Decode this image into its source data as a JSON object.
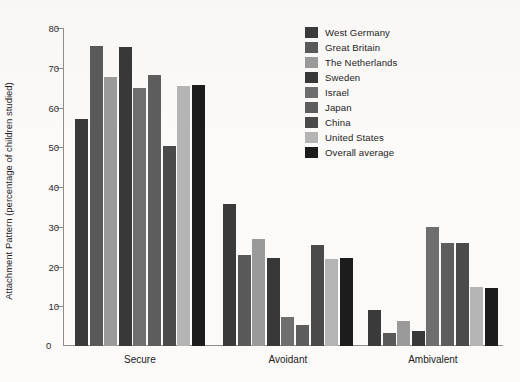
{
  "chart_data": {
    "type": "bar",
    "title": "",
    "subtitle": "",
    "xlabel": "",
    "ylabel": "Attachment Pattern (percentage of children studied)",
    "categories": [
      "Secure",
      "Avoidant",
      "Ambivalent"
    ],
    "ylim": [
      0,
      80
    ],
    "yticks": [
      0,
      10,
      20,
      30,
      40,
      50,
      60,
      70,
      80
    ],
    "ytick_labels": [
      "0",
      "10",
      "20",
      "30",
      "40",
      "50",
      "60",
      "70",
      "80"
    ],
    "grid": false,
    "legend_position": "upper right",
    "series": [
      {
        "name": "West Germany",
        "color": "#3a3a3a",
        "values": [
          57.0,
          35.8,
          9.0
        ]
      },
      {
        "name": "Great Britain",
        "color": "#595959",
        "values": [
          75.4,
          22.8,
          3.4
        ]
      },
      {
        "name": "The Netherlands",
        "color": "#9a9a9a",
        "values": [
          67.6,
          27.0,
          6.2
        ]
      },
      {
        "name": "Sweden",
        "color": "#383838",
        "values": [
          75.1,
          22.2,
          3.9
        ]
      },
      {
        "name": "Israel",
        "color": "#6e6e6e",
        "values": [
          64.8,
          7.2,
          29.9
        ]
      },
      {
        "name": "Japan",
        "color": "#5d5d5d",
        "values": [
          68.2,
          5.3,
          26.0
        ]
      },
      {
        "name": "China",
        "color": "#4a4a4a",
        "values": [
          50.4,
          25.5,
          25.8
        ]
      },
      {
        "name": "United States",
        "color": "#b4b4b4",
        "values": [
          65.4,
          21.8,
          14.8
        ]
      },
      {
        "name": "Overall average",
        "color": "#1c1c1c",
        "values": [
          65.6,
          22.2,
          14.5
        ]
      }
    ]
  },
  "legend": {
    "items": [
      {
        "label": "West Germany"
      },
      {
        "label": "Great Britain"
      },
      {
        "label": "The Netherlands"
      },
      {
        "label": "Sweden"
      },
      {
        "label": "Israel"
      },
      {
        "label": "Japan"
      },
      {
        "label": "China"
      },
      {
        "label": "United States"
      },
      {
        "label": "Overall average"
      }
    ]
  }
}
